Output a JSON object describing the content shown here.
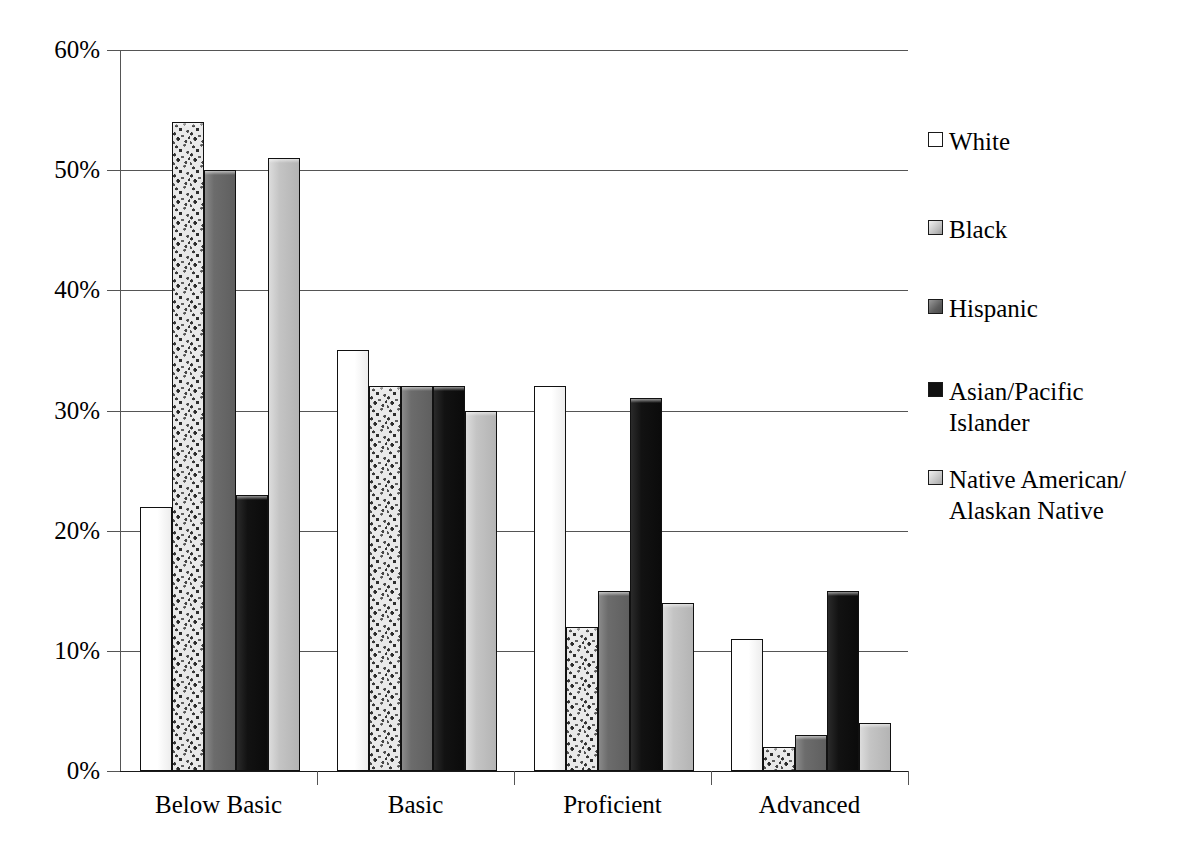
{
  "chart_data": {
    "type": "bar",
    "title": "",
    "subtitle": "",
    "xlabel": "",
    "ylabel": "",
    "categories": [
      "Below Basic",
      "Basic",
      "Proficient",
      "Advanced"
    ],
    "ylim": [
      0,
      60
    ],
    "ytick_values": [
      60,
      50,
      40,
      30,
      20,
      10,
      0
    ],
    "ytick_labels": [
      "60%",
      "50%",
      "40%",
      "30%",
      "20%",
      "10%",
      "0%"
    ],
    "grid": "horizontal",
    "legend_position": "right",
    "value_format": "percent",
    "series": [
      {
        "name": "White",
        "swatch": "white",
        "color": "#ffffff",
        "values": [
          22,
          35,
          32,
          11
        ]
      },
      {
        "name": "Black",
        "swatch": "speckle",
        "color": "#e9e9e9",
        "values": [
          54,
          32,
          12,
          2
        ]
      },
      {
        "name": "Hispanic",
        "swatch": "darkgray",
        "color": "#6f6f6f",
        "values": [
          50,
          32,
          15,
          3
        ]
      },
      {
        "name": "Asian/Pacific\nIslander",
        "swatch": "black",
        "color": "#141414",
        "values": [
          23,
          32,
          31,
          15
        ]
      },
      {
        "name": "Native American/\nAlaskan Native",
        "swatch": "lightgray",
        "color": "#c3c3c3",
        "values": [
          51,
          30,
          14,
          4
        ]
      }
    ]
  },
  "axes": {
    "gridline_color": "#555555",
    "axis_color": "#1a1a1a",
    "background": "#ffffff"
  }
}
